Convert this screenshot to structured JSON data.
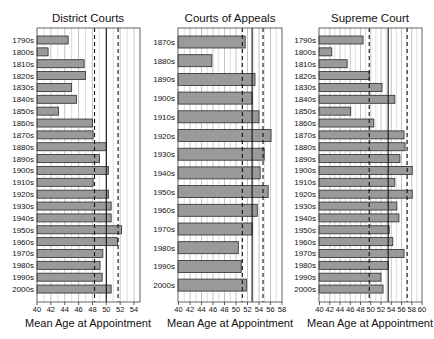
{
  "figure": {
    "xlabel": "Mean Age at Appointment"
  },
  "chart_data": [
    {
      "type": "bar",
      "orientation": "horizontal",
      "title": "District Courts",
      "xlabel": "Mean Age at Appointment",
      "ylabel": "",
      "xlim": [
        40,
        55
      ],
      "xticks": [
        40,
        42,
        44,
        46,
        48,
        50,
        52,
        54
      ],
      "grid": true,
      "categories": [
        "1790s",
        "1800s",
        "1810s",
        "1820s",
        "1830s",
        "1840s",
        "1850s",
        "1860s",
        "1870s",
        "1880s",
        "1890s",
        "1900s",
        "1910s",
        "1920s",
        "1930s",
        "1940s",
        "1950s",
        "1960s",
        "1970s",
        "1980s",
        "1990s",
        "2000s"
      ],
      "values": [
        44.5,
        41.6,
        46.8,
        47.0,
        45.0,
        45.7,
        43.1,
        48.0,
        48.1,
        50.0,
        49.0,
        50.3,
        48.1,
        50.3,
        50.7,
        50.7,
        52.2,
        51.6,
        49.5,
        49.1,
        49.4,
        50.7
      ],
      "reference_lines": [
        {
          "value": 48.3,
          "style": "dashed"
        },
        {
          "value": 50.0,
          "style": "solid"
        },
        {
          "value": 51.7,
          "style": "dashed"
        }
      ]
    },
    {
      "type": "bar",
      "orientation": "horizontal",
      "title": "Courts of Appeals",
      "xlabel": "Mean Age at Appointment",
      "ylabel": "",
      "xlim": [
        40,
        58
      ],
      "xticks": [
        40,
        42,
        44,
        46,
        48,
        50,
        52,
        54,
        56,
        58
      ],
      "grid": true,
      "categories": [
        "1870s",
        "1880s",
        "1890s",
        "1900s",
        "1910s",
        "1920s",
        "1930s",
        "1940s",
        "1950s",
        "1960s",
        "1970s",
        "1980s",
        "1990s",
        "2000s"
      ],
      "values": [
        51.6,
        45.8,
        53.3,
        52.8,
        54.0,
        56.1,
        54.9,
        54.2,
        55.6,
        53.7,
        52.8,
        50.4,
        50.9,
        51.8
      ],
      "reference_lines": [
        {
          "value": 51.1,
          "style": "dashed"
        },
        {
          "value": 52.8,
          "style": "solid"
        },
        {
          "value": 54.7,
          "style": "dashed"
        }
      ]
    },
    {
      "type": "bar",
      "orientation": "horizontal",
      "title": "Supreme Court",
      "xlabel": "Mean Age at Appointment",
      "ylabel": "",
      "xlim": [
        40,
        60
      ],
      "xticks": [
        40,
        42,
        44,
        46,
        48,
        50,
        52,
        54,
        56,
        58,
        60
      ],
      "grid": true,
      "categories": [
        "1790s",
        "1800s",
        "1810s",
        "1820s",
        "1830s",
        "1840s",
        "1850s",
        "1860s",
        "1870s",
        "1880s",
        "1890s",
        "1900s",
        "1910s",
        "1920s",
        "1930s",
        "1940s",
        "1950s",
        "1960s",
        "1970s",
        "1980s",
        "1990s",
        "2000s"
      ],
      "values": [
        48.5,
        42.4,
        45.4,
        49.7,
        52.2,
        54.7,
        46.1,
        50.6,
        56.5,
        56.7,
        55.7,
        58.1,
        54.7,
        58.1,
        55.1,
        55.5,
        53.6,
        54.3,
        56.5,
        53.4,
        52.0,
        52.4
      ],
      "reference_lines": [
        {
          "value": 49.7,
          "style": "dashed"
        },
        {
          "value": 53.4,
          "style": "solid"
        },
        {
          "value": 57.1,
          "style": "dashed"
        }
      ]
    }
  ],
  "style": {
    "bar_fill": "#9a9a9a",
    "bar_stroke": "#2a2a2a",
    "grid_color": "#bdbdbd",
    "frame_color": "#555555",
    "ref_line_color": "#111111"
  },
  "layout": {
    "panels": [
      {
        "plot_left": 37,
        "plot_right": 140,
        "x0_px": 37,
        "px_per_unit": 6.93,
        "plot_top": 28,
        "plot_bottom": 302,
        "row_first_y": 40,
        "row_step": 11.86,
        "bar_h": 8,
        "label_right": 34,
        "title_cx": 88
      },
      {
        "plot_left": 178,
        "plot_right": 282,
        "x0_px": 178.5,
        "px_per_unit": 5.75,
        "plot_top": 28,
        "plot_bottom": 302,
        "row_first_y": 42,
        "row_step": 18.7,
        "bar_h": 12,
        "label_right": 175,
        "title_cx": 230
      },
      {
        "plot_left": 319,
        "plot_right": 422,
        "x0_px": 319.5,
        "px_per_unit": 5.125,
        "plot_top": 28,
        "plot_bottom": 302,
        "row_first_y": 40,
        "row_step": 11.86,
        "bar_h": 8,
        "label_right": 316,
        "title_cx": 370
      }
    ]
  }
}
